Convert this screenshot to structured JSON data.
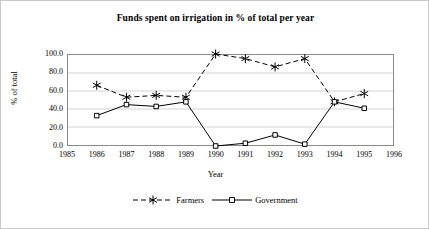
{
  "chart_data": {
    "type": "line",
    "title": "Funds spent on irrigation in % of total per year",
    "xlabel": "Year",
    "ylabel": "% of total",
    "x": [
      1986,
      1987,
      1988,
      1989,
      1990,
      1991,
      1992,
      1993,
      1994,
      1995
    ],
    "xtick_labels": [
      "1985",
      "1986",
      "1987",
      "1988",
      "1989",
      "1990",
      "1991",
      "1992",
      "1993",
      "1994",
      "1995",
      "1996"
    ],
    "xlim": [
      1985,
      1996
    ],
    "ytick_labels": [
      "100.0",
      "80.0",
      "60.0",
      "40.0",
      "20.0",
      "0.0"
    ],
    "ytick_values": [
      100.0,
      80.0,
      60.0,
      40.0,
      20.0,
      0.0
    ],
    "ylim": [
      0,
      100
    ],
    "grid": "horizontal",
    "legend_position": "bottom",
    "series": [
      {
        "name": "Farmers",
        "marker": "asterisk",
        "linestyle": "dashed",
        "color": "#000000",
        "values": [
          66,
          53,
          55,
          53,
          100,
          95,
          86,
          95,
          48,
          57
        ]
      },
      {
        "name": "Government",
        "marker": "square",
        "linestyle": "solid",
        "color": "#000000",
        "values": [
          33,
          45,
          43,
          48,
          0,
          3,
          12,
          2,
          48,
          41
        ]
      }
    ]
  },
  "legend": {
    "entries": [
      {
        "label": "Farmers"
      },
      {
        "label": "Government"
      }
    ]
  }
}
